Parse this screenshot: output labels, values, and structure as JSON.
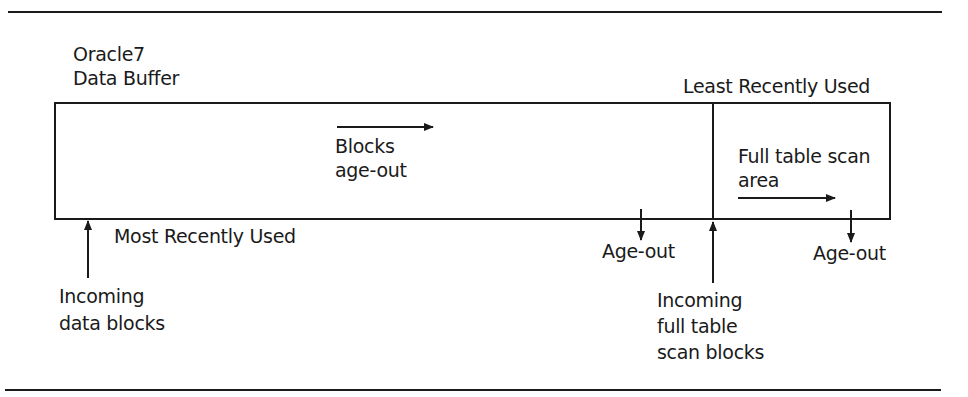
{
  "diagram": {
    "title": [
      "Oracle7",
      "Data Buffer"
    ],
    "lru_label": "Least Recently Used",
    "mru_label": "Most Recently Used",
    "blocks_age_out": [
      "Blocks",
      "age-out"
    ],
    "fts_area": [
      "Full table scan",
      "area"
    ],
    "age_out_left": "Age-out",
    "age_out_right": "Age-out",
    "incoming_data": [
      "Incoming",
      "data blocks"
    ],
    "incoming_fts": [
      "Incoming",
      "full table",
      "scan blocks"
    ]
  }
}
